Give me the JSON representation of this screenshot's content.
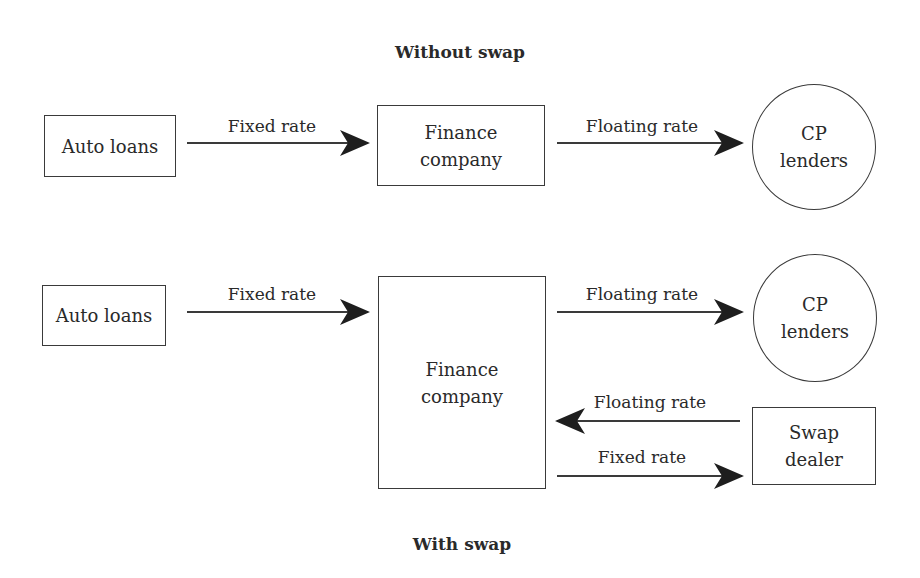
{
  "diagram": {
    "without_swap": {
      "title": "Without swap",
      "nodes": {
        "auto_loans": "Auto loans",
        "finance_company": "Finance\ncompany",
        "cp_lenders": "CP\nlenders"
      },
      "edges": [
        {
          "from": "Auto loans",
          "to": "Finance company",
          "label": "Fixed rate"
        },
        {
          "from": "Finance company",
          "to": "CP lenders",
          "label": "Floating rate"
        }
      ]
    },
    "with_swap": {
      "title": "With swap",
      "nodes": {
        "auto_loans": "Auto loans",
        "finance_company": "Finance\ncompany",
        "cp_lenders": "CP\nlenders",
        "swap_dealer": "Swap\ndealer"
      },
      "edges": [
        {
          "from": "Auto loans",
          "to": "Finance company",
          "label": "Fixed rate"
        },
        {
          "from": "Finance company",
          "to": "CP lenders",
          "label": "Floating rate"
        },
        {
          "from": "Swap dealer",
          "to": "Finance company",
          "label": "Floating rate"
        },
        {
          "from": "Finance company",
          "to": "Swap dealer",
          "label": "Fixed rate"
        }
      ]
    },
    "colors": {
      "stroke": "#3a3a3a",
      "text": "#2a2a2a",
      "background": "#ffffff"
    }
  }
}
